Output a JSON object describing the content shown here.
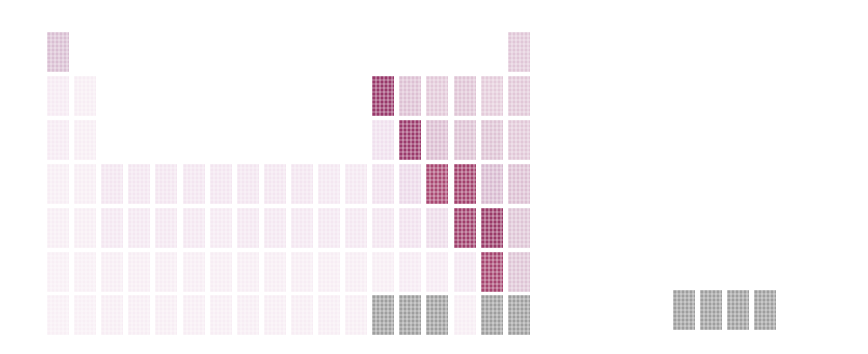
{
  "figure": {
    "title": "",
    "background_color": "#ffffff",
    "width": 868,
    "height": 354
  },
  "chart_data": {
    "type": "heatmap",
    "title": "",
    "subtitle": "",
    "xlabel": "",
    "ylabel": "",
    "grid": false,
    "legend_position": "none",
    "layout": "periodic-table",
    "axis_ranges": {
      "groups": [
        1,
        18
      ],
      "periods": [
        1,
        7
      ]
    },
    "tick_labels": {
      "groups": [
        "1",
        "2",
        "3",
        "4",
        "5",
        "6",
        "7",
        "8",
        "9",
        "10",
        "11",
        "12",
        "13",
        "14",
        "15",
        "16",
        "17",
        "18"
      ],
      "periods": [
        "1",
        "2",
        "3",
        "4",
        "5",
        "6",
        "7"
      ]
    },
    "colorscale": {
      "name": "white-to-maroon",
      "low_color": "#fdfbfe",
      "mid_color": "#d7b3cb",
      "high_color": "#8e3560",
      "missing_color": "#9e9e9e",
      "missing_label": "no data"
    },
    "geometry": {
      "origin_x": 47,
      "origin_y": 32,
      "col_pitch": 27.1,
      "row_pitch": 43.9,
      "cell_width": 22,
      "cell_height": 40
    },
    "cells": [
      {
        "symbol": "H",
        "group": 1,
        "period": 1,
        "value": 0.3,
        "color": "#d9bed2"
      },
      {
        "symbol": "He",
        "group": 18,
        "period": 1,
        "value": 0.24,
        "color": "#e0c6d7"
      },
      {
        "symbol": "Li",
        "group": 1,
        "period": 2,
        "value": 0.07,
        "color": "#f6eaf3"
      },
      {
        "symbol": "Be",
        "group": 2,
        "period": 2,
        "value": 0.06,
        "color": "#f7edf4"
      },
      {
        "symbol": "B",
        "group": 13,
        "period": 2,
        "value": 0.75,
        "color": "#98386a"
      },
      {
        "symbol": "C",
        "group": 14,
        "period": 2,
        "value": 0.26,
        "color": "#ddc0d3"
      },
      {
        "symbol": "N",
        "group": 15,
        "period": 2,
        "value": 0.21,
        "color": "#e2c8d8"
      },
      {
        "symbol": "O",
        "group": 16,
        "period": 2,
        "value": 0.23,
        "color": "#dfc4d5"
      },
      {
        "symbol": "F",
        "group": 17,
        "period": 2,
        "value": 0.2,
        "color": "#e4cbda"
      },
      {
        "symbol": "Ne",
        "group": 18,
        "period": 2,
        "value": 0.22,
        "color": "#e1c7d7"
      },
      {
        "symbol": "Na",
        "group": 1,
        "period": 3,
        "value": 0.07,
        "color": "#f6eaf3"
      },
      {
        "symbol": "Mg",
        "group": 2,
        "period": 3,
        "value": 0.06,
        "color": "#f7edf4"
      },
      {
        "symbol": "Al",
        "group": 13,
        "period": 3,
        "value": 0.1,
        "color": "#f0e0ee"
      },
      {
        "symbol": "Si",
        "group": 14,
        "period": 3,
        "value": 0.73,
        "color": "#9b3a6c"
      },
      {
        "symbol": "P",
        "group": 15,
        "period": 3,
        "value": 0.27,
        "color": "#dbbdd1"
      },
      {
        "symbol": "S",
        "group": 16,
        "period": 3,
        "value": 0.25,
        "color": "#ddc1d3"
      },
      {
        "symbol": "Cl",
        "group": 17,
        "period": 3,
        "value": 0.24,
        "color": "#dec3d4"
      },
      {
        "symbol": "Ar",
        "group": 18,
        "period": 3,
        "value": 0.22,
        "color": "#e1c7d7"
      },
      {
        "symbol": "K",
        "group": 1,
        "period": 4,
        "value": 0.06,
        "color": "#f7edf4"
      },
      {
        "symbol": "Ca",
        "group": 2,
        "period": 4,
        "value": 0.06,
        "color": "#f7edf4"
      },
      {
        "symbol": "Sc",
        "group": 3,
        "period": 4,
        "value": 0.09,
        "color": "#f3e5f0"
      },
      {
        "symbol": "Ti",
        "group": 4,
        "period": 4,
        "value": 0.09,
        "color": "#f3e5f0"
      },
      {
        "symbol": "V",
        "group": 5,
        "period": 4,
        "value": 0.09,
        "color": "#f3e5f0"
      },
      {
        "symbol": "Cr",
        "group": 6,
        "period": 4,
        "value": 0.09,
        "color": "#f3e5f0"
      },
      {
        "symbol": "Mn",
        "group": 7,
        "period": 4,
        "value": 0.09,
        "color": "#f3e5f0"
      },
      {
        "symbol": "Fe",
        "group": 8,
        "period": 4,
        "value": 0.09,
        "color": "#f3e5f0"
      },
      {
        "symbol": "Co",
        "group": 9,
        "period": 4,
        "value": 0.09,
        "color": "#f3e5f0"
      },
      {
        "symbol": "Ni",
        "group": 10,
        "period": 4,
        "value": 0.09,
        "color": "#f3e5f0"
      },
      {
        "symbol": "Cu",
        "group": 11,
        "period": 4,
        "value": 0.08,
        "color": "#f4e7f1"
      },
      {
        "symbol": "Zn",
        "group": 12,
        "period": 4,
        "value": 0.08,
        "color": "#f4e7f1"
      },
      {
        "symbol": "Ga",
        "group": 13,
        "period": 4,
        "value": 0.1,
        "color": "#f1e1ee"
      },
      {
        "symbol": "Ge",
        "group": 14,
        "period": 4,
        "value": 0.13,
        "color": "#ecd9e9"
      },
      {
        "symbol": "As",
        "group": 15,
        "period": 4,
        "value": 0.62,
        "color": "#a94872"
      },
      {
        "symbol": "Se",
        "group": 16,
        "period": 4,
        "value": 0.66,
        "color": "#a2416d"
      },
      {
        "symbol": "Br",
        "group": 17,
        "period": 4,
        "value": 0.3,
        "color": "#d8bad0"
      },
      {
        "symbol": "Kr",
        "group": 18,
        "period": 4,
        "value": 0.26,
        "color": "#dcbfd2"
      },
      {
        "symbol": "Rb",
        "group": 1,
        "period": 5,
        "value": 0.06,
        "color": "#f7edf4"
      },
      {
        "symbol": "Sr",
        "group": 2,
        "period": 5,
        "value": 0.06,
        "color": "#f7edf4"
      },
      {
        "symbol": "Y",
        "group": 3,
        "period": 5,
        "value": 0.08,
        "color": "#f4e7f1"
      },
      {
        "symbol": "Zr",
        "group": 4,
        "period": 5,
        "value": 0.08,
        "color": "#f4e7f1"
      },
      {
        "symbol": "Nb",
        "group": 5,
        "period": 5,
        "value": 0.08,
        "color": "#f4e7f1"
      },
      {
        "symbol": "Mo",
        "group": 6,
        "period": 5,
        "value": 0.08,
        "color": "#f4e7f1"
      },
      {
        "symbol": "Tc",
        "group": 7,
        "period": 5,
        "value": 0.07,
        "color": "#f5e9f2"
      },
      {
        "symbol": "Ru",
        "group": 8,
        "period": 5,
        "value": 0.08,
        "color": "#f4e7f1"
      },
      {
        "symbol": "Rh",
        "group": 9,
        "period": 5,
        "value": 0.08,
        "color": "#f4e7f1"
      },
      {
        "symbol": "Pd",
        "group": 10,
        "period": 5,
        "value": 0.08,
        "color": "#f4e7f1"
      },
      {
        "symbol": "Ag",
        "group": 11,
        "period": 5,
        "value": 0.08,
        "color": "#f4e7f1"
      },
      {
        "symbol": "Cd",
        "group": 12,
        "period": 5,
        "value": 0.08,
        "color": "#f4e7f1"
      },
      {
        "symbol": "In",
        "group": 13,
        "period": 5,
        "value": 0.09,
        "color": "#f3e5f0"
      },
      {
        "symbol": "Sn",
        "group": 14,
        "period": 5,
        "value": 0.1,
        "color": "#f1e1ee"
      },
      {
        "symbol": "Sb",
        "group": 15,
        "period": 5,
        "value": 0.12,
        "color": "#eddbe9"
      },
      {
        "symbol": "Te",
        "group": 16,
        "period": 5,
        "value": 0.68,
        "color": "#9f3e6b"
      },
      {
        "symbol": "I",
        "group": 17,
        "period": 5,
        "value": 0.72,
        "color": "#993a68"
      },
      {
        "symbol": "Xe",
        "group": 18,
        "period": 5,
        "value": 0.24,
        "color": "#dec4d5"
      },
      {
        "symbol": "Cs",
        "group": 1,
        "period": 6,
        "value": 0.05,
        "color": "#f8eff5"
      },
      {
        "symbol": "Ba",
        "group": 2,
        "period": 6,
        "value": 0.05,
        "color": "#f8eff5"
      },
      {
        "symbol": "La",
        "group": 3,
        "period": 6,
        "value": 0.06,
        "color": "#f7edf4"
      },
      {
        "symbol": "Hf",
        "group": 4,
        "period": 6,
        "value": 0.06,
        "color": "#f7edf4"
      },
      {
        "symbol": "Ta",
        "group": 5,
        "period": 6,
        "value": 0.06,
        "color": "#f7edf4"
      },
      {
        "symbol": "W",
        "group": 6,
        "period": 6,
        "value": 0.06,
        "color": "#f7edf4"
      },
      {
        "symbol": "Re",
        "group": 7,
        "period": 6,
        "value": 0.06,
        "color": "#f7edf4"
      },
      {
        "symbol": "Os",
        "group": 8,
        "period": 6,
        "value": 0.06,
        "color": "#f7edf4"
      },
      {
        "symbol": "Ir",
        "group": 9,
        "period": 6,
        "value": 0.06,
        "color": "#f7edf4"
      },
      {
        "symbol": "Pt",
        "group": 10,
        "period": 6,
        "value": 0.06,
        "color": "#f7edf4"
      },
      {
        "symbol": "Au",
        "group": 11,
        "period": 6,
        "value": 0.06,
        "color": "#f7edf4"
      },
      {
        "symbol": "Hg",
        "group": 12,
        "period": 6,
        "value": 0.06,
        "color": "#f7edf4"
      },
      {
        "symbol": "Tl",
        "group": 13,
        "period": 6,
        "value": 0.06,
        "color": "#f7edf4"
      },
      {
        "symbol": "Pb",
        "group": 14,
        "period": 6,
        "value": 0.07,
        "color": "#f6eaf3"
      },
      {
        "symbol": "Bi",
        "group": 15,
        "period": 6,
        "value": 0.07,
        "color": "#f6eaf3"
      },
      {
        "symbol": "Po",
        "group": 16,
        "period": 6,
        "value": 0.08,
        "color": "#f4e7f1"
      },
      {
        "symbol": "At",
        "group": 17,
        "period": 6,
        "value": 0.64,
        "color": "#a5446f"
      },
      {
        "symbol": "Rn",
        "group": 18,
        "period": 6,
        "value": 0.24,
        "color": "#dec4d5"
      },
      {
        "symbol": "Fr",
        "group": 1,
        "period": 7,
        "value": 0.05,
        "color": "#f8eff5"
      },
      {
        "symbol": "Ra",
        "group": 2,
        "period": 7,
        "value": 0.05,
        "color": "#f8eff5"
      },
      {
        "symbol": "Ac",
        "group": 3,
        "period": 7,
        "value": 0.06,
        "color": "#f7edf4"
      },
      {
        "symbol": "Rf",
        "group": 4,
        "period": 7,
        "value": 0.06,
        "color": "#f7edf4"
      },
      {
        "symbol": "Db",
        "group": 5,
        "period": 7,
        "value": 0.06,
        "color": "#f7edf4"
      },
      {
        "symbol": "Sg",
        "group": 6,
        "period": 7,
        "value": 0.06,
        "color": "#f7edf4"
      },
      {
        "symbol": "Bh",
        "group": 7,
        "period": 7,
        "value": 0.06,
        "color": "#f7edf4"
      },
      {
        "symbol": "Hs",
        "group": 8,
        "period": 7,
        "value": 0.06,
        "color": "#f7edf4"
      },
      {
        "symbol": "Mt",
        "group": 9,
        "period": 7,
        "value": 0.06,
        "color": "#f7edf4"
      },
      {
        "symbol": "Ds",
        "group": 10,
        "period": 7,
        "value": 0.06,
        "color": "#f7edf4"
      },
      {
        "symbol": "Rg",
        "group": 11,
        "period": 7,
        "value": 0.06,
        "color": "#f7edf4"
      },
      {
        "symbol": "Cn",
        "group": 12,
        "period": 7,
        "value": 0.06,
        "color": "#f7edf4"
      },
      {
        "symbol": "Nh",
        "group": 13,
        "period": 7,
        "value": null,
        "color": "#9e9e9e"
      },
      {
        "symbol": "Fl",
        "group": 14,
        "period": 7,
        "value": null,
        "color": "#9e9e9e"
      },
      {
        "symbol": "Mc",
        "group": 15,
        "period": 7,
        "value": null,
        "color": "#9e9e9e"
      },
      {
        "symbol": "Lv",
        "group": 16,
        "period": 7,
        "value": 0.06,
        "color": "#f7edf4"
      },
      {
        "symbol": "Ts",
        "group": 17,
        "period": 7,
        "value": null,
        "color": "#9e9e9e"
      },
      {
        "symbol": "Og",
        "group": 18,
        "period": 7,
        "value": null,
        "color": "#9e9e9e"
      }
    ],
    "extra_cells": [
      {
        "symbol": "X13-7b",
        "x": 673,
        "y": 290,
        "value": null,
        "color": "#9e9e9e"
      },
      {
        "symbol": "X14-7b",
        "x": 700,
        "y": 290,
        "value": null,
        "color": "#9e9e9e"
      },
      {
        "symbol": "X15-7b",
        "x": 727,
        "y": 290,
        "value": null,
        "color": "#9e9e9e"
      },
      {
        "symbol": "X16-7b",
        "x": 754,
        "y": 290,
        "value": null,
        "color": "#9e9e9e"
      }
    ]
  }
}
